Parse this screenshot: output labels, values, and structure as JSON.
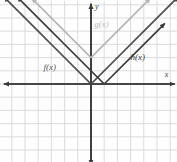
{
  "figure": {
    "kind": "coordinate-plane-graph",
    "width": 177,
    "height": 162,
    "background": "#fefefe"
  },
  "chart_data": {
    "type": "line",
    "title": "",
    "xlabel": "x",
    "ylabel": "y",
    "grid": true,
    "legend_position": "inline-labels",
    "xlim": [
      -6.9,
      6.5
    ],
    "ylim": [
      -5.9,
      6.3
    ],
    "grid_step": 1,
    "origin_px": [
      91,
      84
    ],
    "unit_px": 13.2,
    "axis_color": "#3b3b3b",
    "grid_color": "#d8d8d8",
    "series": [
      {
        "name": "f(x)",
        "label": "f(x)",
        "shape": "absolute-value-V",
        "vertex": [
          0,
          0
        ],
        "slope": 1,
        "color": "#4a4a4a",
        "label_pos": [
          -3.6,
          1.2
        ],
        "points": [
          [
            -6.6,
            6.6
          ],
          [
            0,
            0
          ],
          [
            6.6,
            6.6
          ]
        ],
        "arrows": [
          "left-end",
          "right-end"
        ]
      },
      {
        "name": "g(x)",
        "label": "g(x)",
        "shape": "absolute-value-V",
        "vertex": [
          0,
          2
        ],
        "slope": 1,
        "color": "#b6b6b6",
        "label_pos": [
          0.25,
          4.5
        ],
        "points": [
          [
            -4.5,
            6.5
          ],
          [
            0,
            2
          ],
          [
            4.5,
            6.5
          ]
        ],
        "arrows": [
          "left-end",
          "right-end"
        ]
      },
      {
        "name": "h(x)",
        "label": "h(x)",
        "shape": "absolute-value-V",
        "vertex": [
          1,
          0
        ],
        "slope": 1,
        "color": "#3a3a3a",
        "label_pos": [
          3.0,
          2.0
        ],
        "points": [
          [
            -5.6,
            6.6
          ],
          [
            1,
            0
          ],
          [
            5.6,
            4.6
          ]
        ],
        "arrows": [
          "left-end",
          "right-end"
        ]
      }
    ],
    "axis_labels": {
      "x": "x",
      "y": "y"
    }
  }
}
